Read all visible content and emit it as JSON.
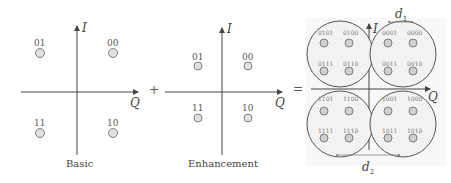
{
  "diagram": {
    "type": "constellation-superposition",
    "panels": [
      {
        "id": "basic",
        "caption": "Basic",
        "x_axis": "Q",
        "y_axis": "I",
        "points": [
          {
            "label": "01",
            "quadrant": "top-left"
          },
          {
            "label": "00",
            "quadrant": "top-right"
          },
          {
            "label": "11",
            "quadrant": "bottom-left"
          },
          {
            "label": "10",
            "quadrant": "bottom-right"
          }
        ]
      },
      {
        "id": "enhancement",
        "caption": "Enhancement",
        "x_axis": "Q",
        "y_axis": "I",
        "points": [
          {
            "label": "01",
            "quadrant": "top-left"
          },
          {
            "label": "00",
            "quadrant": "top-right"
          },
          {
            "label": "11",
            "quadrant": "bottom-left"
          },
          {
            "label": "10",
            "quadrant": "bottom-right"
          }
        ]
      },
      {
        "id": "combined",
        "caption": "",
        "x_axis": "Q",
        "y_axis": "I",
        "clusters": [
          {
            "quadrant": "top-left",
            "points": [
              "0101",
              "0100",
              "0111",
              "0110"
            ]
          },
          {
            "quadrant": "top-right",
            "points": [
              "0001",
              "0000",
              "0011",
              "0010"
            ]
          },
          {
            "quadrant": "bottom-left",
            "points": [
              "1101",
              "1100",
              "1111",
              "1110"
            ]
          },
          {
            "quadrant": "bottom-right",
            "points": [
              "1001",
              "1000",
              "1011",
              "1010"
            ]
          }
        ],
        "distances": {
          "d1": "d",
          "d1_sub": "1",
          "d2": "d",
          "d2_sub": "2"
        }
      }
    ],
    "operators": {
      "plus": "+",
      "equals": "="
    }
  },
  "colors": {
    "axis": "#444444",
    "point_fill": "#d9d9d9",
    "point_stroke": "#666666",
    "cluster_stroke": "#555555",
    "cluster_fill": "#f7f7f7"
  }
}
